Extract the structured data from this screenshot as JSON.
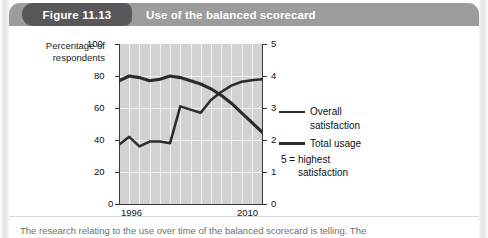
{
  "figure": {
    "number_label": "Figure 11.13",
    "title": "Use of the balanced scorecard",
    "caption": "The research relating to the use over time of the balanced scorecard is telling. The"
  },
  "colors": {
    "header_band": "#9c9c9c",
    "pill": "#58585a",
    "plot_background": "#d2d2d2",
    "gridline": "#f2f2f2",
    "line": "#2b2b2b",
    "axis": "#3a3a3a",
    "page": "#ffffff"
  },
  "chart_data": {
    "type": "line",
    "title": "Use of the balanced scorecard",
    "xlabel": "",
    "ylabel": "Percentage of respondents",
    "y2label": "",
    "x": [
      1996,
      1997,
      1998,
      1999,
      2000,
      2001,
      2002,
      2003,
      2004,
      2005,
      2006,
      2007,
      2008,
      2009,
      2010
    ],
    "xtick_labels": [
      "1996",
      "2010"
    ],
    "xlim": [
      1996,
      2010
    ],
    "ylim": [
      0,
      100
    ],
    "yticks": [
      0,
      20,
      40,
      60,
      80,
      100
    ],
    "y2lim": [
      0,
      5
    ],
    "y2ticks": [
      0,
      1,
      2,
      3,
      4,
      5
    ],
    "grid": true,
    "legend_position": "right",
    "note": "5 = highest satisfaction",
    "note_line1": "5 = highest",
    "note_line2": "satisfaction",
    "series": [
      {
        "name": "Total usage",
        "axis": "left",
        "unit": "percent",
        "values": [
          77,
          80,
          79,
          77,
          78,
          80,
          79,
          77,
          75,
          72,
          68,
          63,
          57,
          51,
          45
        ]
      },
      {
        "name": "Overall satisfaction",
        "axis": "right",
        "unit": "rating",
        "values": [
          1.85,
          2.1,
          1.8,
          1.95,
          1.95,
          1.9,
          3.05,
          2.95,
          2.85,
          3.25,
          3.5,
          3.7,
          3.82,
          3.87,
          3.9
        ],
        "values_as_percent_scale": [
          37,
          42,
          36,
          39,
          39,
          38,
          61,
          59,
          57,
          65,
          70,
          74,
          76.4,
          77.4,
          78
        ]
      }
    ],
    "legend": [
      {
        "label_line1": "Overall",
        "label_line2": "satisfaction",
        "label": "Overall satisfaction",
        "style": "thin"
      },
      {
        "label_line1": "Total usage",
        "label_line2": "",
        "label": "Total usage",
        "style": "thick"
      }
    ]
  },
  "axis_labels": {
    "left_title_line1": "Percentage of",
    "left_title_line2": "respondents",
    "left_ticks": [
      "100",
      "80",
      "60",
      "40",
      "20",
      "0"
    ],
    "right_ticks": [
      "5",
      "4",
      "3",
      "2",
      "1",
      "0"
    ],
    "x_start": "1996",
    "x_end": "2010"
  }
}
